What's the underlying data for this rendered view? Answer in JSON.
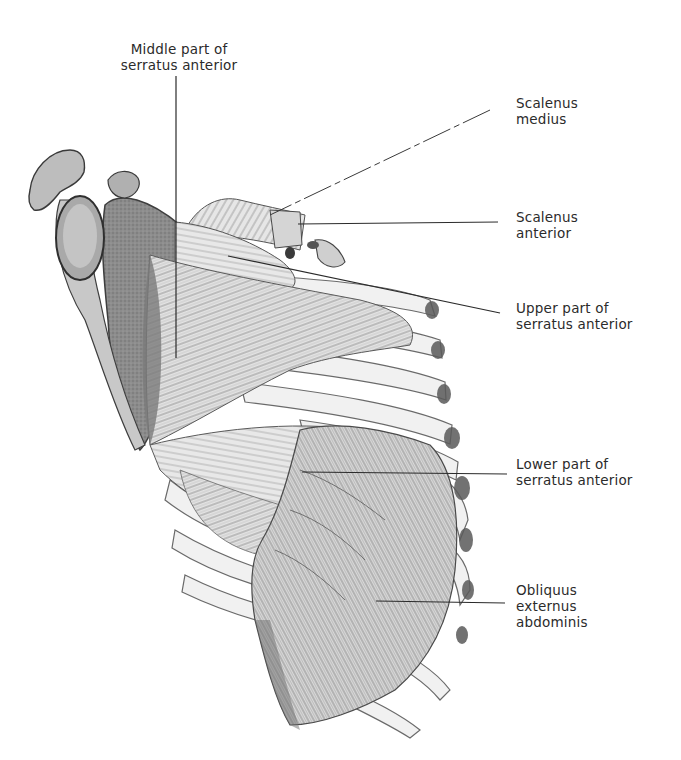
{
  "figure": {
    "background_color": "#ffffff",
    "ink_color": "#2b2b2b",
    "shade_dark": "#6e6e6e",
    "shade_mid": "#a8a8a8",
    "shade_light": "#dcdcdc"
  },
  "labels": [
    {
      "id": "middle-serratus",
      "lines": [
        "Middle part of",
        "serratus anterior"
      ],
      "leader": {
        "x1": 176,
        "y1": 76,
        "x2": 176,
        "y2": 358
      }
    },
    {
      "id": "scalenus-medius",
      "lines": [
        "Scalenus",
        "medius"
      ],
      "leader": {
        "x1": 490,
        "y1": 110,
        "x2": 270,
        "y2": 215
      }
    },
    {
      "id": "scalenus-anterior",
      "lines": [
        "Scalenus",
        "anterior"
      ],
      "leader": {
        "x1": 498,
        "y1": 222,
        "x2": 298,
        "y2": 224
      }
    },
    {
      "id": "upper-serratus",
      "lines": [
        "Upper part of",
        "serratus anterior"
      ],
      "leader": {
        "x1": 500,
        "y1": 313,
        "x2": 228,
        "y2": 256
      }
    },
    {
      "id": "lower-serratus",
      "lines": [
        "Lower part of",
        "serratus anterior"
      ],
      "leader": {
        "x1": 507,
        "y1": 474,
        "x2": 302,
        "y2": 472
      }
    },
    {
      "id": "obliquus-externus",
      "lines": [
        "Obliquus",
        "externus",
        "abdominis"
      ],
      "leader": {
        "x1": 505,
        "y1": 603,
        "x2": 376,
        "y2": 601
      }
    }
  ]
}
